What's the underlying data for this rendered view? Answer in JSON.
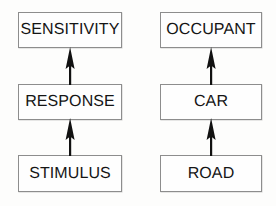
{
  "diagram": {
    "type": "flow-diagram",
    "orientation": "bottom-to-top",
    "background_color": "#fdfdfc",
    "box_border_color": "#8d8d8d",
    "box_fill_color": "#fefefe",
    "text_color": "#151515",
    "arrow_color": "#111111",
    "columns": [
      {
        "id": "abstract-chain",
        "name": "abstract",
        "nodes": [
          {
            "id": "sensitivity",
            "label": "SENSITIVITY",
            "level": 2
          },
          {
            "id": "response",
            "label": "RESPONSE",
            "level": 1
          },
          {
            "id": "stimulus",
            "label": "STIMULUS",
            "level": 0
          }
        ],
        "arrows": [
          {
            "id": "stimulus-to-response",
            "from": "STIMULUS",
            "to": "RESPONSE",
            "direction": "up"
          },
          {
            "id": "response-to-sensitivity",
            "from": "RESPONSE",
            "to": "SENSITIVITY",
            "direction": "up"
          }
        ]
      },
      {
        "id": "concrete-chain",
        "name": "concrete",
        "nodes": [
          {
            "id": "occupant",
            "label": "OCCUPANT",
            "level": 2
          },
          {
            "id": "car",
            "label": "CAR",
            "level": 1
          },
          {
            "id": "road",
            "label": "ROAD",
            "level": 0
          }
        ],
        "arrows": [
          {
            "id": "road-to-car",
            "from": "ROAD",
            "to": "CAR",
            "direction": "up"
          },
          {
            "id": "car-to-occupant",
            "from": "CAR",
            "to": "OCCUPANT",
            "direction": "up"
          }
        ]
      }
    ]
  }
}
